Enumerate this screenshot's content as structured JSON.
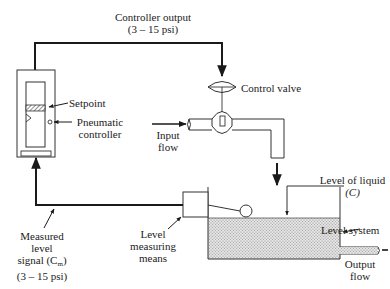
{
  "diagram": {
    "type": "process-control-loop",
    "labels": {
      "controller_output_line1": "Controller output",
      "controller_output_line2": "(3 – 15 psi)",
      "control_valve": "Control valve",
      "setpoint": "Setpoint",
      "pneumatic_controller_line1": "Pneumatic",
      "pneumatic_controller_line2": "controller",
      "input_flow_line1": "Input",
      "input_flow_line2": "flow",
      "level_of_liquid_line1": "Level of liquid",
      "level_of_liquid_line2": "(C)",
      "level_system": "Level system",
      "output_flow_line1": "Output",
      "output_flow_line2": "flow",
      "level_measuring_line1": "Level",
      "level_measuring_line2": "measuring",
      "level_measuring_line3": "means",
      "measured_signal_line1": "Measured",
      "measured_signal_line2": "level",
      "measured_signal_line3_prefix": "signal (C",
      "measured_signal_line3_sub": "m",
      "measured_signal_line3_suffix": ")",
      "measured_signal_line4": "(3 – 15 psi)"
    },
    "nodes": [
      "Pneumatic controller",
      "Control valve",
      "Level system (tank)",
      "Level measuring means (float)"
    ],
    "edges": [
      {
        "from": "Pneumatic controller",
        "to": "Control valve",
        "label": "Controller output (3 – 15 psi)"
      },
      {
        "from": "Control valve",
        "to": "Level system (tank)",
        "label": "flow"
      },
      {
        "from": "Level measuring means (float)",
        "to": "Pneumatic controller",
        "label": "Measured level signal (Cm) (3 – 15 psi)"
      }
    ],
    "colors": {
      "line": "#1a1a1a",
      "liquid_fill": "#d6d6d6"
    }
  }
}
